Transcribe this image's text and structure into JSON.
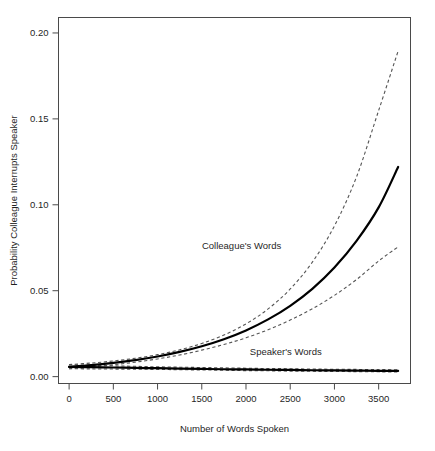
{
  "chart_data": {
    "type": "line",
    "title": "",
    "subtitle": "",
    "xlabel": "Number of Words Spoken",
    "ylabel": "Probability Colleague Interrupts Speaker",
    "xlim": [
      -120,
      3860
    ],
    "ylim": [
      -0.004,
      0.209
    ],
    "xticks": [
      0,
      500,
      1000,
      1500,
      2000,
      2500,
      3000,
      3500
    ],
    "xticklabels": [
      "0",
      "500",
      "1000",
      "1500",
      "2000",
      "2500",
      "3000",
      "3500"
    ],
    "yticks": [
      0.0,
      0.05,
      0.1,
      0.15,
      0.2
    ],
    "yticklabels": [
      "0.00",
      "0.05",
      "0.10",
      "0.15",
      "0.20"
    ],
    "grid": false,
    "legend": "none",
    "annotations": [
      {
        "text": "Colleague's Words",
        "x": 1950,
        "y": 0.0745
      },
      {
        "text": "Speaker's Words",
        "x": 2450,
        "y": 0.0125
      }
    ],
    "x": [
      0,
      250,
      500,
      750,
      1000,
      1250,
      1500,
      1750,
      2000,
      2250,
      2500,
      2750,
      3000,
      3250,
      3500,
      3720
    ],
    "series": [
      {
        "name": "Colleague's Words",
        "style": "solid",
        "values": [
          0.0057,
          0.0067,
          0.008,
          0.0096,
          0.0117,
          0.0144,
          0.0177,
          0.0218,
          0.0269,
          0.0333,
          0.0412,
          0.0511,
          0.0635,
          0.079,
          0.0985,
          0.122
        ]
      },
      {
        "name": "Colleague's Words upper 95% CI",
        "style": "dashed",
        "values": [
          0.007,
          0.0079,
          0.0091,
          0.0107,
          0.0128,
          0.0156,
          0.0193,
          0.0242,
          0.0307,
          0.0394,
          0.051,
          0.0666,
          0.0877,
          0.1163,
          0.1549,
          0.1895
        ]
      },
      {
        "name": "Colleague's Words lower 95% CI",
        "style": "dashed",
        "values": [
          0.0046,
          0.0056,
          0.0069,
          0.0084,
          0.0103,
          0.0126,
          0.0154,
          0.0187,
          0.0226,
          0.0273,
          0.0329,
          0.0395,
          0.0473,
          0.0565,
          0.0673,
          0.0755
        ]
      },
      {
        "name": "Speaker's Words",
        "style": "solid",
        "values": [
          0.0057,
          0.0055,
          0.0053,
          0.0051,
          0.0049,
          0.0047,
          0.0045,
          0.0043,
          0.0042,
          0.004,
          0.0039,
          0.0037,
          0.0036,
          0.0035,
          0.0034,
          0.0033
        ]
      },
      {
        "name": "Speaker's Words upper 95% CI",
        "style": "dashed",
        "values": [
          0.007,
          0.0066,
          0.0063,
          0.006,
          0.0057,
          0.0055,
          0.0053,
          0.0051,
          0.0049,
          0.0047,
          0.0046,
          0.0044,
          0.0043,
          0.0042,
          0.0041,
          0.004
        ]
      },
      {
        "name": "Speaker's Words lower 95% CI",
        "style": "dashed",
        "values": [
          0.0046,
          0.0045,
          0.0044,
          0.0043,
          0.0042,
          0.004,
          0.0039,
          0.0037,
          0.0035,
          0.0034,
          0.0032,
          0.0031,
          0.003,
          0.0029,
          0.0028,
          0.0027
        ]
      }
    ],
    "colors": {
      "fit": "#000000",
      "ci": "#555555",
      "axis": "#4a4a4a",
      "text": "#1f1f1f",
      "background": "#ffffff"
    }
  }
}
